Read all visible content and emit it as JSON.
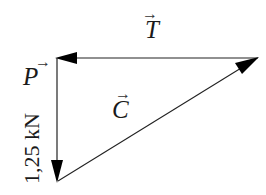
{
  "diagram": {
    "type": "force-triangle",
    "colors": {
      "line": "#222222",
      "arrowhead": "#000000",
      "text": "#1a1a1a",
      "background": "#ffffff"
    },
    "vectors": [
      {
        "id": "T",
        "label": "T",
        "arrow_glyph": "→",
        "from": [
          258,
          58
        ],
        "to": [
          57,
          58
        ],
        "direction": "left"
      },
      {
        "id": "P",
        "label": "P",
        "arrow_glyph": "→",
        "from": [
          57,
          58
        ],
        "to": [
          57,
          182
        ],
        "direction": "down",
        "magnitude": "1,25 kN"
      },
      {
        "id": "C",
        "label": "C",
        "arrow_glyph": "→",
        "from": [
          57,
          182
        ],
        "to": [
          258,
          58
        ],
        "direction": "up-right"
      }
    ]
  }
}
